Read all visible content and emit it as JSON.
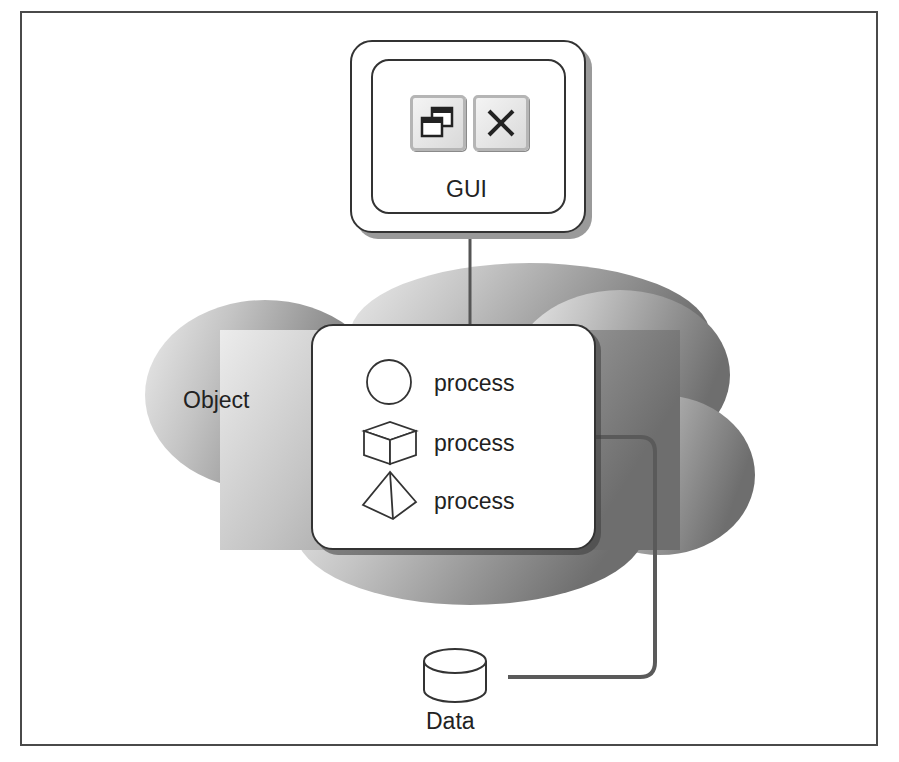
{
  "diagram": {
    "gui": {
      "label": "GUI",
      "buttons": [
        {
          "icon": "restore-window-icon"
        },
        {
          "icon": "close-icon",
          "glyph": "✕"
        }
      ]
    },
    "object": {
      "label": "Object",
      "processes": [
        {
          "icon": "circle-icon",
          "label": "process"
        },
        {
          "icon": "cube-icon",
          "label": "process"
        },
        {
          "icon": "pyramid-icon",
          "label": "process"
        }
      ]
    },
    "data": {
      "icon": "database-cylinder-icon",
      "label": "Data"
    },
    "connections": [
      {
        "from": "GUI",
        "to": "Object"
      },
      {
        "from": "Object",
        "to": "Data"
      }
    ],
    "colors": {
      "cloud_light": "#e4e4e4",
      "cloud_dark": "#7d7d7d",
      "line": "#555555",
      "border": "#333333"
    }
  }
}
